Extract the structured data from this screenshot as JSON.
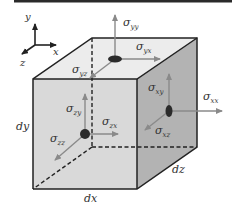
{
  "diagram": {
    "type": "stress-element-cube",
    "colors": {
      "top_bar": "#2a2a2a",
      "front_face": "#d9d9d9",
      "top_face": "#ececec",
      "right_face": "#b3b3b3",
      "edge": "#222222",
      "arrow": "#8a8a8a",
      "disc": "#2b2b2b",
      "text": "#333333"
    },
    "axes": {
      "x": "x",
      "y": "y",
      "z": "z"
    },
    "dimensions": {
      "dx": "dx",
      "dy": "dy",
      "dz": "dz"
    },
    "stresses": {
      "top_face": [
        {
          "sigma": "σ",
          "sub": "yy"
        },
        {
          "sigma": "σ",
          "sub": "yx"
        },
        {
          "sigma": "σ",
          "sub": "yz"
        }
      ],
      "front_face": [
        {
          "sigma": "σ",
          "sub": "zy"
        },
        {
          "sigma": "σ",
          "sub": "zx"
        },
        {
          "sigma": "σ",
          "sub": "zz"
        }
      ],
      "right_face": [
        {
          "sigma": "σ",
          "sub": "xy"
        },
        {
          "sigma": "σ",
          "sub": "xx"
        },
        {
          "sigma": "σ",
          "sub": "xz"
        }
      ]
    }
  }
}
